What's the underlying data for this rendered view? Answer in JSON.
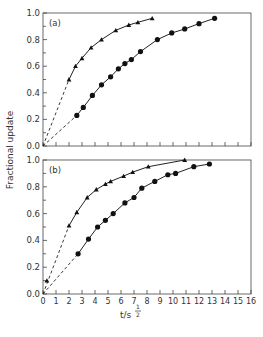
{
  "chart_data": [
    {
      "type": "scatter",
      "panel_label": "(a)",
      "xlabel": "t/s^1/2",
      "ylabel": "Fractional update",
      "xlim": [
        0,
        16
      ],
      "ylim": [
        0,
        1.0
      ],
      "yticks": [
        "0.0",
        "0.2",
        "0.4",
        "0.6",
        "0.8",
        "1.0"
      ],
      "series": [
        {
          "name": "triangles",
          "marker": "triangle",
          "x": [
            2.0,
            2.5,
            3.0,
            3.7,
            4.5,
            5.6,
            6.6,
            7.3,
            8.4
          ],
          "y": [
            0.5,
            0.6,
            0.66,
            0.74,
            0.8,
            0.87,
            0.91,
            0.93,
            0.96
          ],
          "extrapolation": [
            [
              0,
              0
            ],
            [
              2.0,
              0.5
            ]
          ]
        },
        {
          "name": "circles",
          "marker": "circle",
          "x": [
            2.6,
            3.1,
            3.8,
            4.5,
            5.2,
            5.8,
            6.3,
            6.8,
            7.5,
            8.8,
            9.9,
            10.9,
            12.0,
            13.2
          ],
          "y": [
            0.23,
            0.29,
            0.38,
            0.46,
            0.52,
            0.58,
            0.62,
            0.65,
            0.71,
            0.8,
            0.85,
            0.88,
            0.92,
            0.96
          ],
          "extrapolation": [
            [
              0,
              0
            ],
            [
              2.6,
              0.23
            ]
          ]
        }
      ]
    },
    {
      "type": "scatter",
      "panel_label": "(b)",
      "xlabel": "t/s^1/2",
      "ylabel": "Fractional update",
      "xlim": [
        0,
        16
      ],
      "ylim": [
        0,
        1.0
      ],
      "xticks": [
        "0",
        "1",
        "2",
        "3",
        "4",
        "5",
        "6",
        "7",
        "8",
        "9",
        "10",
        "11",
        "12",
        "13",
        "14",
        "15",
        "16"
      ],
      "yticks": [
        "0.0",
        "0.2",
        "0.4",
        "0.6",
        "0.8",
        "1.0"
      ],
      "series": [
        {
          "name": "triangles",
          "marker": "triangle",
          "x": [
            0.3,
            2.0,
            2.6,
            3.4,
            4.1,
            4.8,
            5.2,
            6.2,
            6.9,
            8.1,
            10.9
          ],
          "y": [
            0.1,
            0.51,
            0.61,
            0.72,
            0.78,
            0.82,
            0.84,
            0.88,
            0.91,
            0.95,
            1.0
          ],
          "extrapolation": [
            [
              0,
              0
            ],
            [
              2.0,
              0.51
            ]
          ]
        },
        {
          "name": "circles",
          "marker": "circle",
          "x": [
            2.7,
            3.5,
            4.2,
            4.8,
            5.4,
            6.3,
            7.0,
            7.6,
            8.6,
            9.6,
            10.2,
            11.6,
            12.8
          ],
          "y": [
            0.3,
            0.41,
            0.5,
            0.55,
            0.6,
            0.68,
            0.72,
            0.79,
            0.84,
            0.89,
            0.9,
            0.95,
            0.97
          ],
          "extrapolation": [
            [
              0,
              0
            ],
            [
              2.7,
              0.3
            ]
          ]
        }
      ]
    }
  ],
  "labels": {
    "ylabel": "Fractional update",
    "xlabel_main": "t/s",
    "xlabel_exp": "1",
    "xlabel_exp_den": "2",
    "panel_a": "(a)",
    "panel_b": "(b)"
  }
}
